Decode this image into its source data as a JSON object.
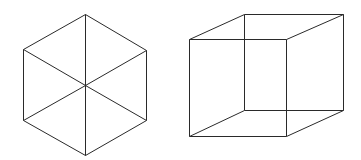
{
  "figures": [
    {
      "name": "hexagon-with-diagonals",
      "stroke": "#2a2a2a",
      "vertices": {
        "top": [
          85,
          14
        ],
        "upper_right": [
          146,
          50
        ],
        "lower_right": [
          146,
          120
        ],
        "bottom": [
          85,
          155
        ],
        "lower_left": [
          23,
          120
        ],
        "upper_left": [
          23,
          49
        ],
        "center": [
          85,
          85
        ]
      }
    },
    {
      "name": "necker-cube-wireframe",
      "stroke": "#2a2a2a",
      "vertices": {
        "front_top_left": [
          189,
          39
        ],
        "front_top_right": [
          286,
          39
        ],
        "front_bottom_left": [
          189,
          136
        ],
        "front_bottom_right": [
          286,
          136
        ],
        "back_top_left": [
          244,
          14
        ],
        "back_top_right": [
          343,
          14
        ],
        "back_bottom_left": [
          244,
          110
        ],
        "back_bottom_right": [
          343,
          110
        ]
      }
    }
  ]
}
